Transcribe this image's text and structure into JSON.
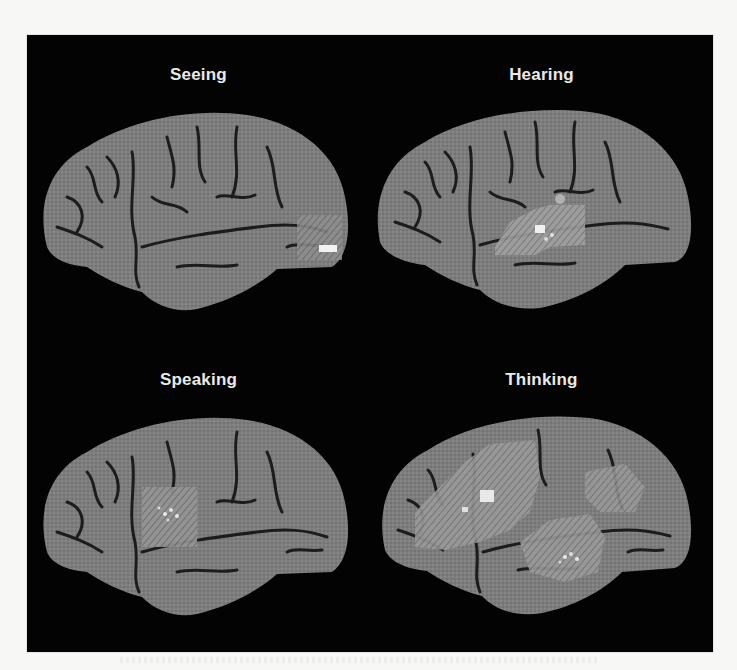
{
  "figure": {
    "background_color": "#030303",
    "page_color": "#f7f7f5",
    "label_color": "#e9e9e9",
    "brain_color": "#7a7a7a",
    "panels": [
      {
        "label": "Seeing",
        "activation_region": "occipital (posterior)"
      },
      {
        "label": "Hearing",
        "activation_region": "superior temporal"
      },
      {
        "label": "Speaking",
        "activation_region": "motor / premotor (central)"
      },
      {
        "label": "Thinking",
        "activation_region": "frontal, parietal, temporal (widespread)"
      }
    ]
  }
}
